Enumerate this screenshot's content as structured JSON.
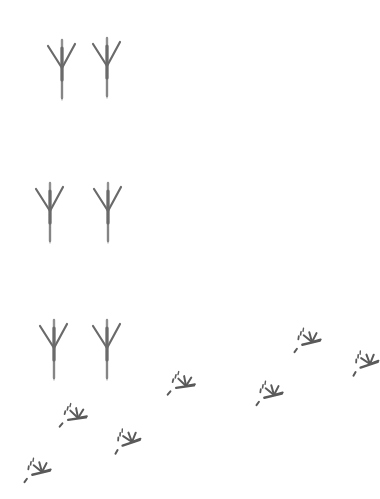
{
  "scene": {
    "description": "Pencil illustration of bird footprints on white background",
    "background": "#ffffff",
    "ink_color": "#6b6b6b",
    "large_tracks": [
      {
        "x": 62,
        "y": 40,
        "rot": 0
      },
      {
        "x": 107,
        "y": 38,
        "rot": 0
      },
      {
        "x": 50,
        "y": 183,
        "rot": 0
      },
      {
        "x": 108,
        "y": 183,
        "rot": 0
      },
      {
        "x": 54,
        "y": 320,
        "rot": 0
      },
      {
        "x": 107,
        "y": 320,
        "rot": 0
      }
    ],
    "small_tracks": [
      {
        "x": 312,
        "y": 340,
        "rot": -10
      },
      {
        "x": 370,
        "y": 362,
        "rot": -15
      },
      {
        "x": 186,
        "y": 384,
        "rot": -5
      },
      {
        "x": 274,
        "y": 393,
        "rot": -10
      },
      {
        "x": 78,
        "y": 414,
        "rot": -5
      },
      {
        "x": 132,
        "y": 440,
        "rot": -15
      },
      {
        "x": 42,
        "y": 470,
        "rot": -10
      }
    ]
  }
}
